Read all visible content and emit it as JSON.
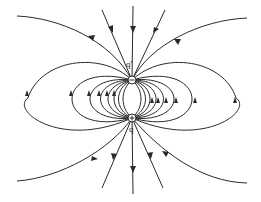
{
  "diagram": {
    "type": "electric field lines of a dipole",
    "charges": [
      {
        "id": "top",
        "label": "q'",
        "sign": "−",
        "x": 132,
        "y": 80
      },
      {
        "id": "bottom",
        "label": "q",
        "sign": "+",
        "x": 132,
        "y": 118
      }
    ],
    "colors": {
      "line": "#2a2a2a",
      "background": "#ffffff"
    }
  }
}
